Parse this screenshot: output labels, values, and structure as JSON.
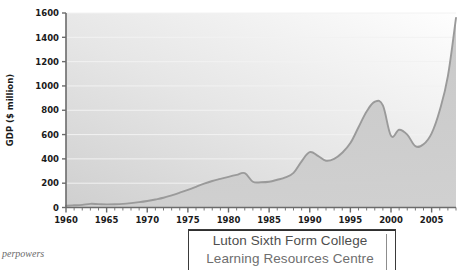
{
  "figure": {
    "caption_fragment": "perpowers"
  },
  "stamp": {
    "line1": "Luton Sixth Form College",
    "line2": "Learning Resources Centre"
  },
  "axis": {
    "y_label": "GDP ($ million)",
    "y_ticks": [
      "0",
      "200",
      "400",
      "600",
      "800",
      "1000",
      "1200",
      "1400",
      "1600"
    ],
    "x_ticks": [
      "1960",
      "1965",
      "1970",
      "1975",
      "1980",
      "1985",
      "1990",
      "1995",
      "2000",
      "2005"
    ]
  },
  "colors": {
    "line": "#9a9a9a",
    "fill": "#c9c9c9",
    "axis": "#6b6b6b",
    "gridline": "#f2f2f2",
    "text": "#1a1a1a",
    "plot_bg_light": "#fdfdfd",
    "plot_bg_dark": "#d2d2d2"
  },
  "chart_data": {
    "type": "area",
    "title": "",
    "xlabel": "",
    "ylabel": "GDP ($ million)",
    "xlim": [
      1960,
      2008
    ],
    "ylim": [
      0,
      1600
    ],
    "grid": true,
    "legend": "none",
    "x_tick_interval": 5,
    "x_minor_tick_interval": 1,
    "y_tick_interval": 200,
    "x": [
      1960,
      1961,
      1962,
      1963,
      1964,
      1965,
      1966,
      1967,
      1968,
      1969,
      1970,
      1971,
      1972,
      1973,
      1974,
      1975,
      1976,
      1977,
      1978,
      1979,
      1980,
      1981,
      1982,
      1983,
      1984,
      1985,
      1986,
      1987,
      1988,
      1989,
      1990,
      1991,
      1992,
      1993,
      1994,
      1995,
      1996,
      1997,
      1998,
      1999,
      2000,
      2001,
      2002,
      2003,
      2004,
      2005,
      2006,
      2007,
      2008
    ],
    "values": [
      15,
      18,
      22,
      30,
      28,
      26,
      27,
      30,
      36,
      44,
      54,
      66,
      80,
      100,
      122,
      145,
      170,
      196,
      218,
      235,
      252,
      268,
      282,
      212,
      208,
      212,
      228,
      248,
      285,
      380,
      455,
      425,
      385,
      400,
      450,
      530,
      660,
      790,
      870,
      840,
      590,
      640,
      600,
      505,
      520,
      610,
      800,
      1080,
      1560
    ],
    "series": [
      {
        "name": "GDP ($ million)",
        "values": [
          15,
          18,
          22,
          30,
          28,
          26,
          27,
          30,
          36,
          44,
          54,
          66,
          80,
          100,
          122,
          145,
          170,
          196,
          218,
          235,
          252,
          268,
          282,
          212,
          208,
          212,
          228,
          248,
          285,
          380,
          455,
          425,
          385,
          400,
          450,
          530,
          660,
          790,
          870,
          840,
          590,
          640,
          600,
          505,
          520,
          610,
          800,
          1080,
          1560
        ]
      }
    ],
    "annotations": [
      {
        "label": "local peak",
        "x": 1982,
        "y": 282
      },
      {
        "label": "trough",
        "x": 1984,
        "y": 208
      },
      {
        "label": "local peak",
        "x": 1990,
        "y": 455
      },
      {
        "label": "peak",
        "x": 1998,
        "y": 870
      },
      {
        "label": "trough",
        "x": 2003,
        "y": 505
      },
      {
        "label": "end",
        "x": 2008,
        "y": 1560
      }
    ]
  }
}
